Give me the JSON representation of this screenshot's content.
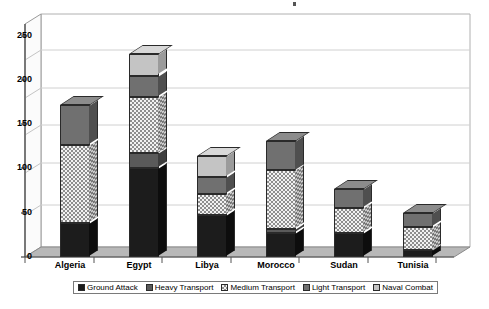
{
  "chart_data": {
    "type": "bar",
    "subtype": "stacked-3d-column",
    "title": "",
    "xlabel": "",
    "ylabel": "",
    "ylim": [
      0,
      250
    ],
    "yticks": [
      0,
      50,
      100,
      150,
      200,
      250
    ],
    "grid": true,
    "legend_position": "bottom",
    "categories": [
      "Algeria",
      "Egypt",
      "Libya",
      "Morocco",
      "Sudan",
      "Tunisia"
    ],
    "series": [
      {
        "name": "Ground Attack",
        "values": [
          40,
          105,
          50,
          28,
          28,
          8
        ]
      },
      {
        "name": "Heavy Transport",
        "values": [
          0,
          18,
          0,
          5,
          0,
          0
        ]
      },
      {
        "name": "Medium Transport",
        "values": [
          93,
          67,
          25,
          70,
          30,
          28
        ]
      },
      {
        "name": "Light Transport",
        "values": [
          47,
          25,
          20,
          35,
          22,
          16
        ]
      },
      {
        "name": "Naval Combat",
        "values": [
          0,
          25,
          25,
          0,
          0,
          0
        ]
      }
    ],
    "totals": [
      180,
      240,
      120,
      138,
      80,
      52
    ]
  },
  "axis": {
    "y_tick_labels": [
      "250",
      "200",
      "150",
      "100",
      "50",
      "0"
    ],
    "x_tick_labels": [
      "Algeria",
      "Egypt",
      "Libya",
      "Morocco",
      "Sudan",
      "Tunisia"
    ]
  },
  "legend": {
    "items": [
      {
        "label": "Ground Attack",
        "color": "#1c1c1c"
      },
      {
        "label": "Heavy Transport",
        "color": "#5a5a5a"
      },
      {
        "label": "Medium Transport",
        "color": "#f2f2f2"
      },
      {
        "label": "Light Transport",
        "color": "#707070"
      },
      {
        "label": "Naval Combat",
        "color": "#c4c4c4"
      }
    ]
  },
  "colors": {
    "plot_background": "#ffffff",
    "floor": "#b8b8b8",
    "gridline": "#c9c9c9",
    "axis": "#555555"
  }
}
